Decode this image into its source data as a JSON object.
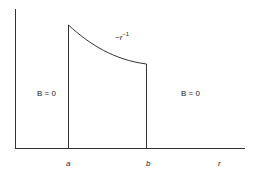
{
  "diagram": {
    "type": "piecewise-field-plot",
    "axes": {
      "x_label": "r",
      "ticks": [
        {
          "label": "a"
        },
        {
          "label": "b"
        }
      ]
    },
    "regions": [
      {
        "name": "inner",
        "label": "B = 0"
      },
      {
        "name": "between",
        "label": "~r",
        "exponent": "−1"
      },
      {
        "name": "outer",
        "label": "B = 0"
      }
    ]
  }
}
